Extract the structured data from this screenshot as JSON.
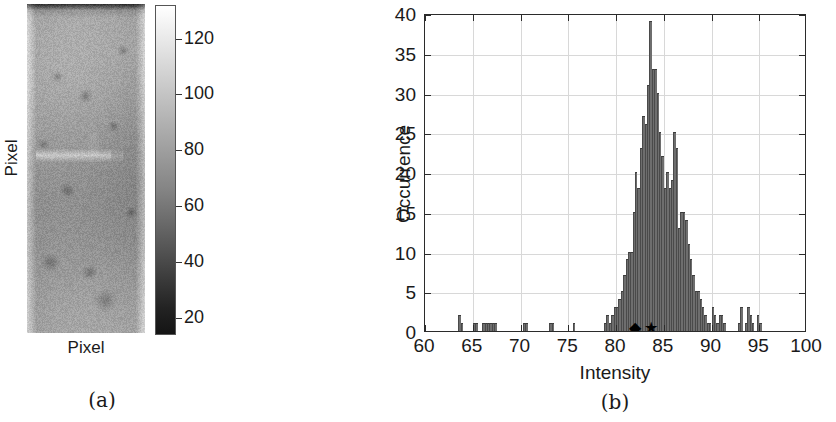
{
  "figure": {
    "panel_a": {
      "caption": "(a)",
      "xlabel": "Pixel",
      "ylabel": "Pixel",
      "image_name": "grayscale-texture-image",
      "colorbar": {
        "ticks": [
          120,
          100,
          80,
          60,
          40,
          20
        ],
        "min": 14,
        "max": 132,
        "low_color": "#141414",
        "high_color": "#ffffff"
      }
    },
    "panel_b": {
      "caption": "(b)"
    }
  },
  "chart_data": {
    "type": "bar",
    "title": "",
    "xlabel": "Intensity",
    "ylabel": "Occurrence",
    "xlim": [
      60,
      100
    ],
    "ylim": [
      0,
      40
    ],
    "xticks": [
      60,
      65,
      70,
      75,
      80,
      85,
      90,
      95,
      100
    ],
    "yticks": [
      0,
      5,
      10,
      15,
      20,
      25,
      30,
      35,
      40
    ],
    "grid": true,
    "bar_color": "#6e6e6e",
    "bin_width": 0.25,
    "x": [
      63.5,
      63.75,
      65.0,
      65.25,
      66.0,
      66.25,
      66.5,
      66.75,
      67.0,
      67.25,
      70.25,
      70.5,
      73.0,
      73.25,
      75.5,
      78.75,
      79.0,
      79.25,
      79.5,
      79.75,
      80.0,
      80.25,
      80.5,
      80.75,
      81.0,
      81.25,
      81.5,
      81.75,
      82.0,
      82.25,
      82.5,
      82.75,
      83.0,
      83.25,
      83.5,
      83.75,
      84.0,
      84.25,
      84.5,
      84.75,
      85.0,
      85.25,
      85.5,
      85.75,
      86.0,
      86.25,
      86.5,
      86.75,
      87.0,
      87.25,
      87.5,
      87.75,
      88.0,
      88.25,
      88.5,
      88.75,
      89.0,
      89.25,
      89.5,
      89.75,
      90.0,
      90.25,
      90.5,
      90.75,
      91.0,
      91.25,
      92.75,
      93.0,
      93.5,
      93.75,
      94.0,
      94.25,
      94.75,
      95.0
    ],
    "values": [
      2,
      1,
      1,
      1,
      1,
      1,
      1,
      1,
      1,
      1,
      1,
      1,
      1,
      1,
      1,
      1,
      2,
      1,
      2,
      3,
      3,
      4,
      5,
      7,
      9,
      10,
      10,
      15,
      20,
      18,
      23,
      27,
      26,
      31,
      39,
      33,
      33,
      30,
      25,
      22,
      18,
      20,
      18,
      19,
      25,
      23,
      13,
      15,
      15,
      14,
      11,
      9,
      7,
      5,
      5,
      4,
      3,
      2,
      1,
      1,
      3,
      2,
      1,
      2,
      2,
      1,
      1,
      3,
      1,
      3,
      2,
      1,
      2,
      1
    ],
    "markers": [
      {
        "name": "diamond-marker",
        "symbol": "◆",
        "x": 82.0,
        "y": 0,
        "color": "#000000"
      },
      {
        "name": "star-marker",
        "symbol": "★",
        "x": 83.7,
        "y": 0,
        "color": "#000000"
      }
    ]
  }
}
